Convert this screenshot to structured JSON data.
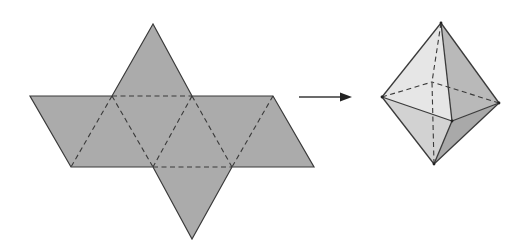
{
  "diagram": {
    "colors": {
      "net_fill": "#ababab",
      "stroke": "#3a3a3a",
      "face_light": "#e6e6e6",
      "face_mid": "#d2d2d2",
      "face_dark": "#b9b9b9",
      "face_darker": "#a9a9a9",
      "background": "#ffffff"
    },
    "net": {
      "outline": [
        [
          153,
          24
        ],
        [
          112,
          96
        ],
        [
          30,
          96
        ],
        [
          71,
          167
        ],
        [
          153,
          167
        ],
        [
          192,
          239
        ],
        [
          232,
          167
        ],
        [
          314,
          167
        ],
        [
          273,
          96
        ],
        [
          192,
          96
        ]
      ],
      "fold_lines": [
        [
          [
            112,
            96
          ],
          [
            192,
            96
          ]
        ],
        [
          [
            153,
            167
          ],
          [
            232,
            167
          ]
        ],
        [
          [
            112,
            96
          ],
          [
            71,
            167
          ]
        ],
        [
          [
            112,
            96
          ],
          [
            153,
            167
          ]
        ],
        [
          [
            192,
            96
          ],
          [
            153,
            167
          ]
        ],
        [
          [
            192,
            96
          ],
          [
            232,
            167
          ]
        ],
        [
          [
            273,
            96
          ],
          [
            232,
            167
          ]
        ]
      ]
    },
    "arrow": {
      "from": [
        299,
        97
      ],
      "to": [
        352,
        97
      ]
    },
    "octahedron": {
      "vertices": {
        "top": [
          441,
          23
        ],
        "left": [
          382,
          97
        ],
        "right": [
          499,
          103
        ],
        "front": [
          452,
          121
        ],
        "back": [
          432,
          82
        ],
        "bottom": [
          434,
          164
        ]
      }
    }
  }
}
